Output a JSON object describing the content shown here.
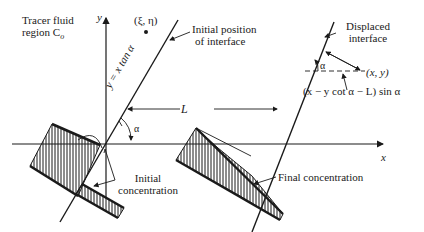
{
  "labels": {
    "tracer_line1": "Tracer fluid",
    "tracer_line2": "region C",
    "tracer_sub": "o",
    "point_xi_eta": "(ξ, η)",
    "y_axis": "y",
    "x_axis": "x",
    "initial_interface_line1": "Initial position",
    "initial_interface_line2": "of interface",
    "interface_equation": "y = x tan α",
    "displaced_line1": "Displaced",
    "displaced_line2": "interface",
    "alpha_upper": "α",
    "alpha_lower": "α",
    "point_xy": "(x, y)",
    "distance_formula": "(x − y cot α − L) sin α",
    "L": "L",
    "initial_conc_line1": "Initial",
    "initial_conc_line2": "concentration",
    "final_conc": "Final concentration"
  },
  "colors": {
    "ink": "#1a1a1a",
    "background": "#ffffff"
  }
}
